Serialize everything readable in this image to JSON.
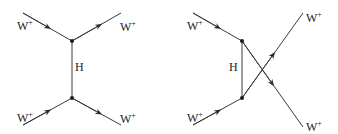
{
  "diagrams": [
    {
      "name": "s-channel",
      "labels": {
        "in_top": "W",
        "in_bottom": "W",
        "out_top": "W",
        "out_bottom": "W",
        "propagator": "H",
        "charge": "+"
      }
    },
    {
      "name": "u-channel",
      "labels": {
        "in_top": "W",
        "in_bottom": "W",
        "out_top": "W",
        "out_bottom": "W",
        "propagator": "H",
        "charge": "+"
      }
    }
  ],
  "colors": {
    "line": "#3a3a3a",
    "background": "#ffffff"
  }
}
